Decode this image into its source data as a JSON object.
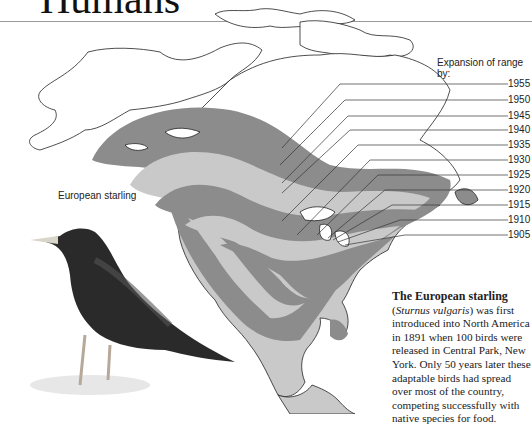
{
  "header": {
    "title": "Humans"
  },
  "legend": {
    "title": "Expansion of range by:",
    "years": [
      "1955",
      "1950",
      "1945",
      "1940",
      "1935",
      "1930",
      "1925",
      "1920",
      "1915",
      "1910",
      "1905"
    ]
  },
  "bird": {
    "label": "European starling"
  },
  "caption": {
    "heading": "The European starling",
    "scientific_name": "Sturnus vulgaris",
    "line2_suffix": ") was first",
    "body": "introduced into North America in 1891 when 100 birds were released in Central Park, New York. Only 50 years later these adaptable birds had spread over most of the country, competing successfully with native species for food."
  },
  "colors": {
    "band_dark": "#8c8c8c",
    "band_light": "#c9c9c9",
    "outline": "#222222"
  }
}
